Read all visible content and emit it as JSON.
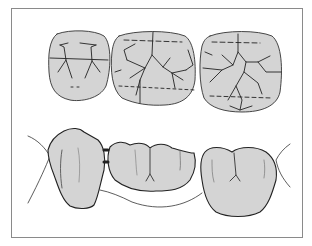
{
  "figure": {
    "colors": {
      "tooth_fill": "#d4d4d4",
      "outline": "#222222",
      "frame": "#8a8a8a",
      "background": "#ffffff"
    },
    "views": [
      {
        "name": "occlusal-view",
        "teeth": [
          "premolar-abutment",
          "pontic",
          "molar-abutment"
        ]
      },
      {
        "name": "buccal-view",
        "teeth": [
          "premolar-abutment",
          "pontic",
          "molar-abutment"
        ]
      }
    ]
  }
}
